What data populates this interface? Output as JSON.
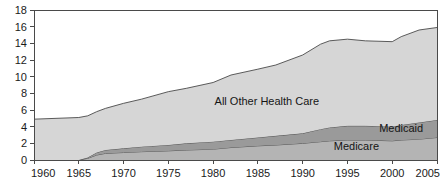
{
  "chart_data": {
    "type": "area",
    "title": "",
    "subtitle": "",
    "xlabel": "",
    "ylabel": "",
    "stacked": true,
    "grid": false,
    "legend_position": "inline-labels",
    "xlim": [
      1960,
      2005
    ],
    "ylim": [
      0,
      18
    ],
    "x_ticks": [
      1960,
      1965,
      1970,
      1975,
      1980,
      1985,
      1990,
      1995,
      2000,
      2005
    ],
    "x_tick_labels": [
      "1960",
      "1965",
      "1970",
      "1975",
      "1980",
      "1985",
      "1990",
      "1995",
      "2000",
      "2005"
    ],
    "y_ticks": [
      0,
      2,
      4,
      6,
      8,
      10,
      12,
      14,
      16,
      18
    ],
    "y_tick_labels": [
      "0",
      "2",
      "4",
      "6",
      "8",
      "10",
      "12",
      "14",
      "16",
      "18"
    ],
    "x": [
      1960,
      1965,
      1966,
      1967,
      1968,
      1970,
      1972,
      1975,
      1977,
      1980,
      1982,
      1985,
      1987,
      1990,
      1992,
      1993,
      1995,
      1997,
      2000,
      2001,
      2003,
      2005
    ],
    "series": [
      {
        "name": "Medicare",
        "label": "Medicare",
        "color": "#b4b4b4",
        "values": [
          0.0,
          0.0,
          0.2,
          0.6,
          0.8,
          0.9,
          1.0,
          1.1,
          1.2,
          1.3,
          1.5,
          1.7,
          1.8,
          2.0,
          2.2,
          2.3,
          2.4,
          2.4,
          2.3,
          2.4,
          2.5,
          2.7
        ]
      },
      {
        "name": "Medicaid",
        "label": "Medicaid",
        "color": "#9a9a9a",
        "values": [
          0.0,
          0.0,
          0.1,
          0.3,
          0.4,
          0.5,
          0.6,
          0.7,
          0.8,
          0.9,
          0.9,
          1.0,
          1.1,
          1.2,
          1.5,
          1.6,
          1.7,
          1.7,
          1.7,
          1.8,
          2.0,
          2.1
        ]
      },
      {
        "name": "All Other Health Care",
        "label": "All Other Health Care",
        "color": "#d6d6d6",
        "values": [
          4.9,
          5.1,
          5.0,
          4.9,
          5.0,
          5.4,
          5.7,
          6.4,
          6.6,
          7.1,
          7.8,
          8.2,
          8.5,
          9.4,
          10.2,
          10.4,
          10.4,
          10.2,
          10.2,
          10.6,
          11.1,
          11.1
        ]
      }
    ],
    "totals": [
      4.9,
      5.1,
      5.3,
      5.8,
      6.2,
      6.8,
      7.3,
      8.2,
      8.6,
      9.3,
      10.2,
      10.9,
      11.4,
      12.6,
      13.9,
      14.3,
      14.5,
      14.3,
      14.2,
      14.8,
      15.6,
      15.9
    ],
    "annotations": [
      {
        "text": "All Other Health Care",
        "x": 1986,
        "y": 6.6
      },
      {
        "text": "Medicaid",
        "x": 2001,
        "y": 3.4
      },
      {
        "text": "Medicare",
        "x": 1996,
        "y": 1.2
      }
    ]
  }
}
